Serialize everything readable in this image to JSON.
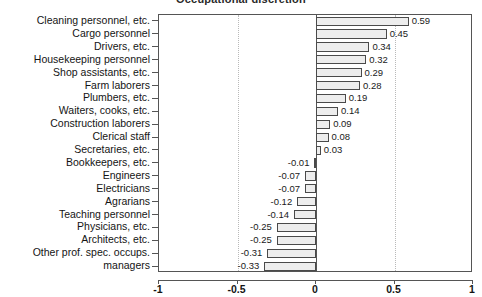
{
  "chart_data": {
    "type": "bar",
    "orientation": "horizontal",
    "title": "Occupational discretion",
    "xlabel": "",
    "ylabel": "",
    "xlim": [
      -1,
      1
    ],
    "xticks": [
      "-1",
      "-0.5",
      "0",
      "0.5",
      "1"
    ],
    "xtick_values": [
      -1,
      -0.5,
      0,
      0.5,
      1
    ],
    "grid": "vertical dotted at -0.5 and 0.5",
    "legend": "none",
    "categories": [
      "Cleaning personnel, etc.",
      "Cargo personnel",
      "Drivers, etc.",
      "Housekeeping personnel",
      "Shop assistants, etc.",
      "Farm laborers",
      "Plumbers, etc.",
      "Waiters, cooks, etc.",
      "Construction laborers",
      "Clerical staff",
      "Secretaries, etc.",
      "Bookkeepers, etc.",
      "Engineers",
      "Electricians",
      "Agrarians",
      "Teaching personnel",
      "Physicians, etc.",
      "Architects, etc.",
      "Other prof. spec. occups.",
      "managers"
    ],
    "values": [
      0.59,
      0.45,
      0.34,
      0.32,
      0.29,
      0.28,
      0.19,
      0.14,
      0.09,
      0.08,
      0.03,
      -0.01,
      -0.07,
      -0.07,
      -0.12,
      -0.14,
      -0.25,
      -0.25,
      -0.31,
      -0.33
    ],
    "value_labels": [
      "0.59",
      "0.45",
      "0.34",
      "0.32",
      "0.29",
      "0.28",
      "0.19",
      "0.14",
      "0.09",
      "0.08",
      "0.03",
      "-0.01",
      "-0.07",
      "-0.07",
      "-0.12",
      "-0.14",
      "-0.25",
      "-0.25",
      "-0.31",
      "-0.33"
    ],
    "colors": {
      "bar_fill": "#ededed",
      "bar_edge": "#4a4a4a",
      "axis": "#555555",
      "grid": "#b9b9b9",
      "text": "#141414"
    }
  }
}
